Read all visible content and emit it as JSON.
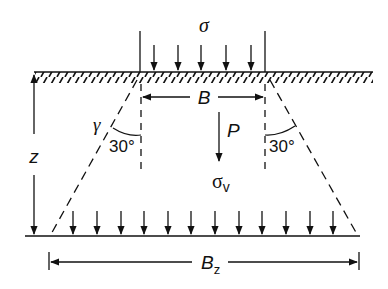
{
  "diagram": {
    "labels": {
      "surface_load": "σ",
      "footing_width": "B",
      "unit_weight": "γ",
      "angle_left": "30°",
      "angle_right": "30°",
      "point_load": "P",
      "vertical_stress": "σ",
      "vertical_stress_sub": "v",
      "depth": "z",
      "spread_width": "B",
      "spread_width_sub": "z"
    },
    "colors": {
      "stroke": "#111111",
      "background": "#ffffff"
    },
    "geometry": {
      "surface_arrow_count": 5,
      "depth_arrow_count": 12,
      "spread_angle_deg": 30
    }
  }
}
